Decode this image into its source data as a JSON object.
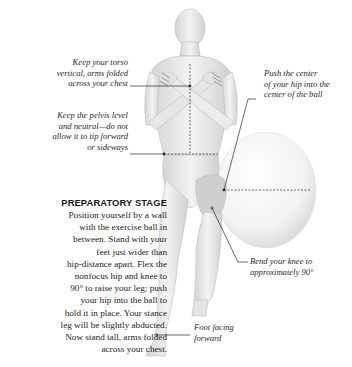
{
  "figure": {
    "skin_color": "#e9e9e9",
    "highlight_color": "#c9c9c9",
    "ball_color": "#f4f4f4",
    "line_color": "#2a2a2a"
  },
  "annotations": {
    "torso": "Keep your torso\nvertical, arms folded\nacross your chest",
    "pelvis": "Keep the pelvis level\nand neutral—do not\nallow it to tip forward\nor sideways",
    "hip": "Push the center\nof your hip into the\ncenter of the ball",
    "knee": "Bend your knee to\napproximately 90°",
    "foot": "Foot facing\nforward"
  },
  "preparatory": {
    "title": "PREPARATORY STAGE",
    "body": "Position yourself by a wall\nwith the exercise ball in\nbetween. Stand with your\nfeet just wider than\nhip-distance apart. Flex the\nnonfocus hip and knee to\n90° to raise your leg; push\nyour hip into the ball to\nhold it in place. Your stance\nleg will be slightly abducted.\nNow stand tall, arms folded\nacross your chest."
  }
}
